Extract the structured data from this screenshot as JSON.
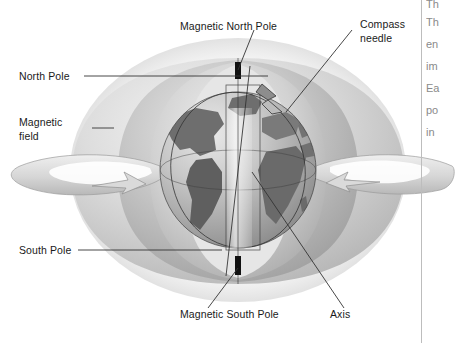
{
  "figure": {
    "kind": "earth-magnetic-field-diagram",
    "palette": {
      "background": "#ffffff",
      "label_text": "#1a1a1a",
      "side_text": "#8a8a8a",
      "leader_line": "#333333",
      "divider": "#bdbdbd",
      "pole_marker": "#111111",
      "field_light": "#e3e3e3",
      "field_mid": "#c9c9c9",
      "field_dark": "#a8a8a8",
      "ocean": "#c4c4c4",
      "land": "#6e6e6e"
    }
  },
  "labels": {
    "magnetic_north_pole": "Magnetic North Pole",
    "compass_needle_line1": "Compass",
    "compass_needle_line2": "needle",
    "north_pole": "North Pole",
    "magnetic_field_line1": "Magnetic",
    "magnetic_field_line2": "field",
    "south_pole": "South Pole",
    "magnetic_south_pole": "Magnetic South Pole",
    "axis": "Axis"
  },
  "side_column": {
    "fragments": [
      "Th",
      "en",
      "im",
      "Ea",
      "po",
      "in"
    ]
  }
}
